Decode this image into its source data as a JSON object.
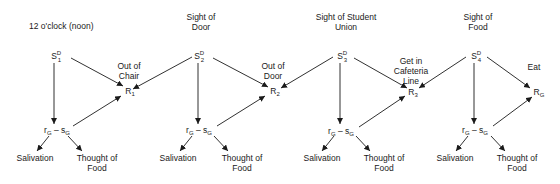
{
  "diagram": {
    "type": "stimulus-response chain",
    "units": [
      {
        "stimulus_caption": "12 o'clock (noon)",
        "stimulus": {
          "base": "S",
          "sup": "D",
          "sub": "1"
        },
        "response_caption": "Out of\nChair",
        "response_caption_lines": [
          "Out of",
          "Chair"
        ],
        "response": {
          "base": "R",
          "sub": "1"
        },
        "goal": {
          "r": "r",
          "r_sub": "G",
          "dash": "–",
          "s": "s",
          "s_sub": "G"
        },
        "outcome_left": "Salivation",
        "outcome_right_lines": [
          "Thought of",
          "Food"
        ]
      },
      {
        "stimulus_caption_lines": [
          "Sight of",
          "Door"
        ],
        "stimulus": {
          "base": "S",
          "sup": "D",
          "sub": "2"
        },
        "response_caption_lines": [
          "Out of",
          "Door"
        ],
        "response": {
          "base": "R",
          "sub": "2"
        },
        "goal": {
          "r": "r",
          "r_sub": "G",
          "dash": "–",
          "s": "s",
          "s_sub": "G"
        },
        "outcome_left": "Salivation",
        "outcome_right_lines": [
          "Thought of",
          "Food"
        ]
      },
      {
        "stimulus_caption_lines": [
          "Sight of Student",
          "Union"
        ],
        "stimulus": {
          "base": "S",
          "sup": "D",
          "sub": "3"
        },
        "response_caption_lines": [
          "Get in",
          "Cafeteria",
          "Line"
        ],
        "response": {
          "base": "R",
          "sub": "3"
        },
        "goal": {
          "r": "r",
          "r_sub": "G",
          "dash": "–",
          "s": "s",
          "s_sub": "G"
        },
        "outcome_left": "Salivation",
        "outcome_right_lines": [
          "Thought of",
          "Food"
        ]
      },
      {
        "stimulus_caption_lines": [
          "Sight of",
          "Food"
        ],
        "stimulus": {
          "base": "S",
          "sup": "D",
          "sub": "4"
        },
        "response_caption_lines": [
          "Eat"
        ],
        "response": {
          "base": "R",
          "sub": "G"
        },
        "goal": {
          "r": "r",
          "r_sub": "G",
          "dash": "–",
          "s": "s",
          "s_sub": "G"
        },
        "outcome_left": "Salivation",
        "outcome_right_lines": [
          "Thought of",
          "Food"
        ]
      }
    ],
    "colors": {
      "ink": "#1a1a1a",
      "background": "#ffffff"
    }
  }
}
